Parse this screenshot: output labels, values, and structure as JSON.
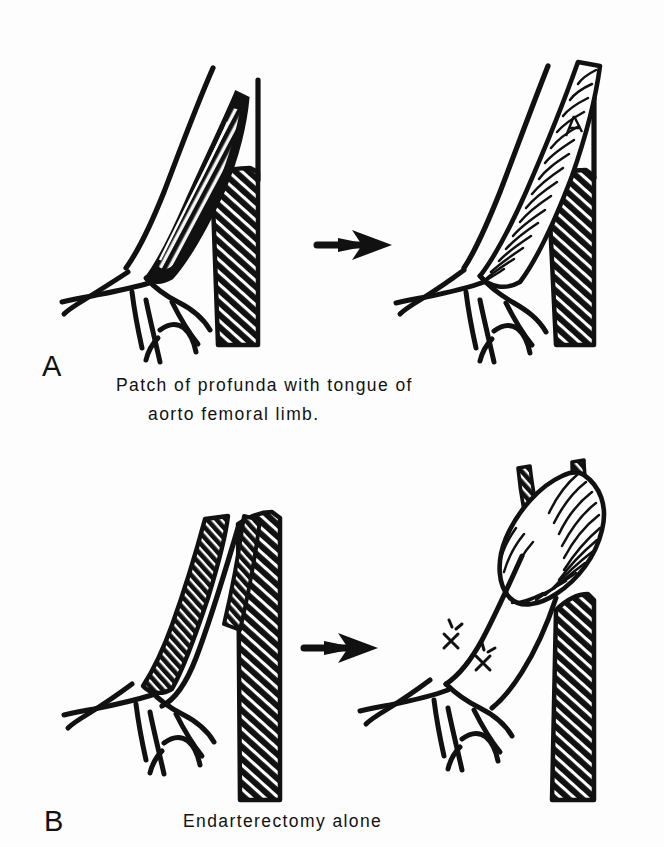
{
  "figure": {
    "type": "medical-surgical-illustration",
    "background_color": "#fdfdfd",
    "ink_color": "#111111",
    "panels": [
      {
        "id": "A",
        "label": "A",
        "caption_line1": "Patch of profunda with tongue of",
        "caption_line2": "aorto femoral limb.",
        "before_description": "Common femoral bifurcation with profunda femoris opened longitudinally exposing atheromatous plaque; occluded superficial femoral artery shown cross-hatched",
        "after_description": "Profunda widened with a corrugated prosthetic patch formed from a tongue of the aorto-femoral graft limb, sutured in place",
        "transition_icon": "right-arrow"
      },
      {
        "id": "B",
        "label": "B",
        "caption_line1": "Endarterectomy alone",
        "before_description": "Common femoral bifurcation with both profunda femoris and superficial femoral artery heavily diseased, shown cross-hatched",
        "after_description": "Profunda femoris cleared by endarterectomy leaving a smooth lumen; corrugated graft limb above, ligature sutures marked on small branches",
        "transition_icon": "right-arrow"
      }
    ],
    "legend_patterns": [
      {
        "name": "diagonal-hatching",
        "meaning": "occluded / atherosclerotic vessel"
      },
      {
        "name": "corrugated-ribbing",
        "meaning": "prosthetic dacron graft or patch"
      },
      {
        "name": "x-mark",
        "meaning": "suture / ligature"
      },
      {
        "name": "open-outline",
        "meaning": "patent vessel lumen"
      }
    ]
  }
}
